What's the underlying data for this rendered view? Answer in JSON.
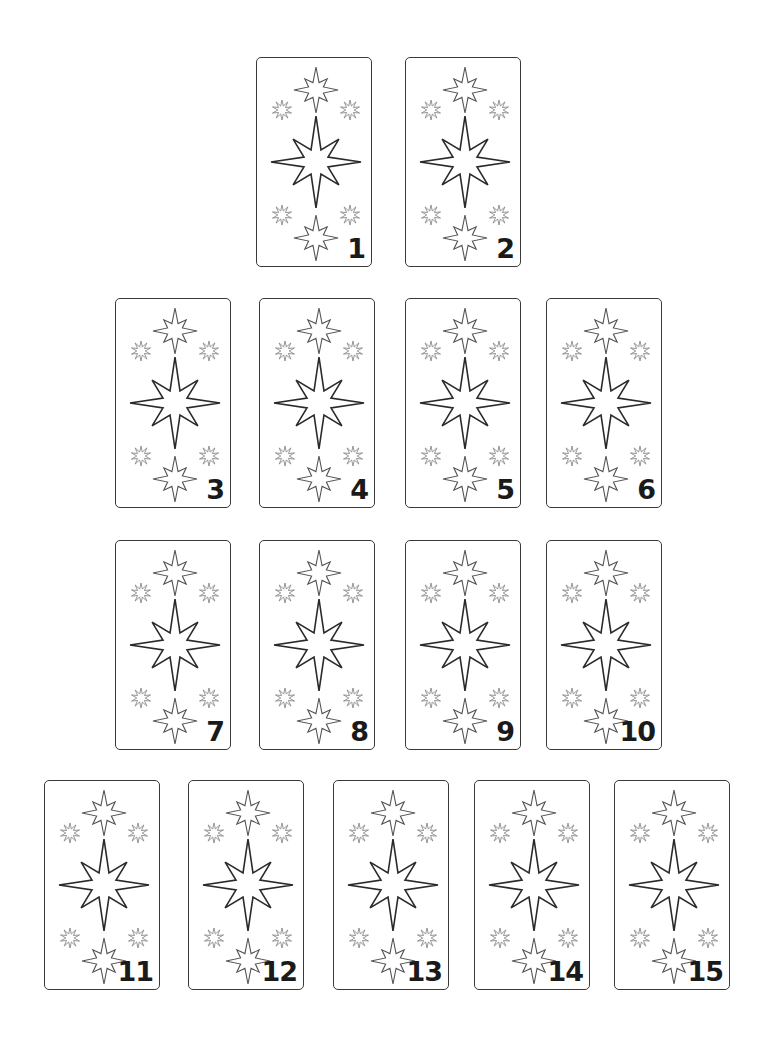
{
  "puzzle": {
    "type": "spot-the-matching-cards",
    "cards": [
      {
        "number": "1",
        "row": 1,
        "x": 256,
        "y": 57
      },
      {
        "number": "2",
        "row": 1,
        "x": 405,
        "y": 57
      },
      {
        "number": "3",
        "row": 2,
        "x": 115,
        "y": 298
      },
      {
        "number": "4",
        "row": 2,
        "x": 259,
        "y": 298
      },
      {
        "number": "5",
        "row": 2,
        "x": 405,
        "y": 298
      },
      {
        "number": "6",
        "row": 2,
        "x": 546,
        "y": 298
      },
      {
        "number": "7",
        "row": 3,
        "x": 115,
        "y": 540
      },
      {
        "number": "8",
        "row": 3,
        "x": 259,
        "y": 540
      },
      {
        "number": "9",
        "row": 3,
        "x": 405,
        "y": 540
      },
      {
        "number": "10",
        "row": 3,
        "x": 546,
        "y": 540
      },
      {
        "number": "11",
        "row": 4,
        "x": 44,
        "y": 780
      },
      {
        "number": "12",
        "row": 4,
        "x": 188,
        "y": 780
      },
      {
        "number": "13",
        "row": 4,
        "x": 333,
        "y": 780
      },
      {
        "number": "14",
        "row": 4,
        "x": 474,
        "y": 780
      },
      {
        "number": "15",
        "row": 4,
        "x": 614,
        "y": 780
      }
    ],
    "card_motif": {
      "center": "large-8-point-star-icon",
      "top": "medium-8-point-star-icon",
      "bottom": "medium-8-point-star-icon",
      "corners": "small-burst-star-icon"
    }
  }
}
